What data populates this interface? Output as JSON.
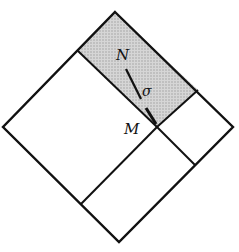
{
  "diagram": {
    "labels": {
      "n": "N",
      "m": "M",
      "sigma": "σ"
    },
    "colors": {
      "stroke": "#111111",
      "shade": "#c8c8c8",
      "background": "#ffffff"
    }
  }
}
